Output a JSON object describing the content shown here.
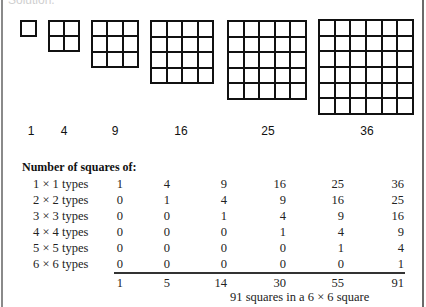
{
  "header": {
    "fragment": "Solution."
  },
  "figure": {
    "squares": [
      {
        "n": 1,
        "label": "1",
        "x": 20,
        "y": 20,
        "size": 17,
        "label_x": 31
      },
      {
        "n": 2,
        "label": "4",
        "x": 48,
        "y": 20,
        "size": 32,
        "label_x": 64
      },
      {
        "n": 3,
        "label": "9",
        "x": 91,
        "y": 20,
        "size": 48,
        "label_x": 115
      },
      {
        "n": 4,
        "label": "16",
        "x": 150,
        "y": 20,
        "size": 64,
        "label_x": 181
      },
      {
        "n": 5,
        "label": "25",
        "x": 227,
        "y": 20,
        "size": 80,
        "label_x": 268
      },
      {
        "n": 6,
        "label": "36",
        "x": 318,
        "y": 19,
        "size": 96,
        "label_x": 367
      }
    ]
  },
  "table": {
    "title": "Number of squares of:",
    "rows": [
      {
        "label": "1 × 1 types",
        "values": [
          "1",
          "4",
          "9",
          "16",
          "25",
          "36"
        ]
      },
      {
        "label": "2 × 2 types",
        "values": [
          "0",
          "1",
          "4",
          "9",
          "16",
          "25"
        ]
      },
      {
        "label": "3 × 3 types",
        "values": [
          "0",
          "0",
          "1",
          "4",
          "9",
          "16"
        ]
      },
      {
        "label": "4 × 4 types",
        "values": [
          "0",
          "0",
          "0",
          "1",
          "4",
          "9"
        ]
      },
      {
        "label": "5 × 5 types",
        "values": [
          "0",
          "0",
          "0",
          "0",
          "1",
          "4"
        ]
      },
      {
        "label": "6 × 6 types",
        "values": [
          "0",
          "0",
          "0",
          "0",
          "0",
          "1"
        ]
      }
    ],
    "totals": [
      "1",
      "5",
      "14",
      "30",
      "55",
      "91"
    ],
    "caption": "91 squares in a 6 × 6 square"
  },
  "layout": {
    "row_tops": [
      177,
      193,
      209,
      225,
      241,
      257
    ],
    "totals_top": 276,
    "col_right_edges": [
      123,
      170,
      227,
      286,
      344,
      404
    ]
  }
}
